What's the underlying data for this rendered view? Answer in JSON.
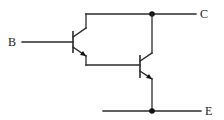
{
  "diagram": {
    "type": "circuit",
    "terminals": {
      "base": "B",
      "collector": "C",
      "emitter": "E"
    },
    "components": [
      {
        "id": "Q1",
        "type": "NPN transistor"
      },
      {
        "id": "Q2",
        "type": "NPN transistor"
      }
    ],
    "connections": [
      "B -> Q1 base",
      "Q1 collector -> C (junction)",
      "Q2 collector -> C (junction)",
      "Q1 emitter -> Q2 base",
      "Q2 emitter -> E (junction)"
    ],
    "colors": {
      "line": "#2a2a2a",
      "background": "#ffffff"
    }
  }
}
